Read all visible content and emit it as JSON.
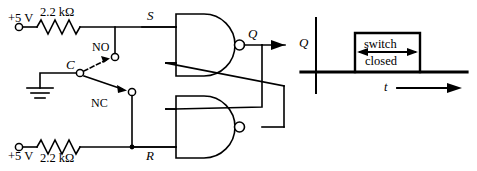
{
  "figure": {
    "title_text": "",
    "circuit": {
      "supply_top": {
        "label": "+5 V",
        "resistor": "2.2 kΩ"
      },
      "supply_bottom": {
        "label": "+5 V",
        "resistor": "2.2 kΩ"
      },
      "switch": {
        "common_label": "C",
        "normally_open_label": "NO",
        "normally_closed_label": "NC"
      },
      "ground_label": "",
      "nodes": {
        "set_label": "S",
        "reset_label": "R",
        "output_label": "Q"
      }
    },
    "timing": {
      "y_axis_label": "Q",
      "x_axis_label": "t",
      "annotation_line1": "switch",
      "annotation_line2": "closed"
    }
  },
  "colors": {
    "ink": "#000000",
    "background": "#ffffff"
  }
}
